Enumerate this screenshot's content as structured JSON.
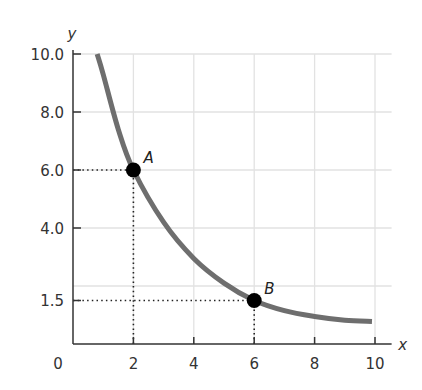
{
  "chart_data": {
    "type": "line",
    "title": "",
    "xlabel": "x",
    "ylabel": "y",
    "xlim": [
      0,
      10
    ],
    "ylim": [
      0,
      10
    ],
    "grid": true,
    "x_ticks": [
      "0",
      "2",
      "4",
      "6",
      "8",
      "10"
    ],
    "y_ticks": [
      "1.5",
      "4.0",
      "6.0",
      "8.0",
      "10.0"
    ],
    "series": [
      {
        "name": "curve",
        "color": "#6e6e6e",
        "x": [
          0.8,
          1.0,
          1.5,
          2.0,
          3.0,
          4.0,
          5.0,
          6.0,
          7.0,
          8.0,
          9.0,
          9.9
        ],
        "y": [
          10.0,
          9.3,
          7.4,
          6.0,
          4.2,
          2.95,
          2.1,
          1.5,
          1.15,
          0.95,
          0.82,
          0.78
        ]
      }
    ],
    "points": [
      {
        "label": "A",
        "x": 2,
        "y": 6.0
      },
      {
        "label": "B",
        "x": 6,
        "y": 1.5
      }
    ],
    "reference_lines": [
      {
        "from": [
          0,
          6.0
        ],
        "to": [
          2,
          6.0
        ],
        "style": "dotted"
      },
      {
        "from": [
          2,
          0
        ],
        "to": [
          2,
          6.0
        ],
        "style": "dotted"
      },
      {
        "from": [
          0,
          1.5
        ],
        "to": [
          6,
          1.5
        ],
        "style": "dotted"
      },
      {
        "from": [
          6,
          0
        ],
        "to": [
          6,
          1.5
        ],
        "style": "dotted"
      }
    ]
  }
}
